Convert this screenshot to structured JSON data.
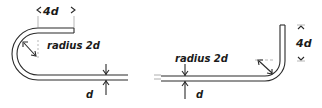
{
  "diagram": {
    "type": "rebar-bend-details",
    "stroke_color": "#2a2a2a",
    "background": "#ffffff",
    "hook_180": {
      "extension_label": "4d",
      "radius_label": "radius 2d",
      "diameter_label": "d"
    },
    "bend_90": {
      "extension_label": "4d",
      "radius_label": "radius 2d",
      "diameter_label": "d"
    }
  }
}
